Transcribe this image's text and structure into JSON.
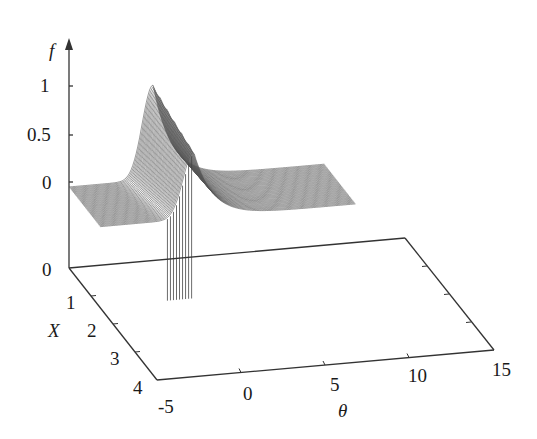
{
  "chart_data": {
    "type": "surface3d",
    "title": "",
    "axes": {
      "z": {
        "label": "f",
        "ticks": [
          "0",
          "0.5",
          "1"
        ],
        "range": [
          0,
          1.1
        ]
      },
      "x": {
        "label": "X",
        "ticks": [
          "0",
          "1",
          "2",
          "3",
          "4"
        ],
        "range": [
          0,
          4
        ]
      },
      "y": {
        "label": "θ",
        "ticks": [
          "-5",
          "0",
          "5",
          "10",
          "15"
        ],
        "range": [
          -5,
          15
        ]
      }
    },
    "peak": {
      "theta": 0,
      "X": 0,
      "f": 1.05
    },
    "profile_at_X0": {
      "theta": [
        -5,
        -3,
        -2,
        -1,
        -0.5,
        0,
        0.5,
        1,
        2,
        3,
        5,
        10,
        15
      ],
      "f": [
        0,
        0.02,
        0.08,
        0.35,
        0.75,
        1.05,
        0.8,
        0.55,
        0.25,
        0.08,
        0.01,
        0,
        0
      ]
    },
    "grid": false,
    "legend": null
  },
  "labels": {
    "f_axis": "f",
    "x_axis": "X",
    "theta_axis": "θ",
    "f_ticks": [
      {
        "t": "1",
        "x": 40,
        "y": 76
      },
      {
        "t": "0.5",
        "x": 27,
        "y": 125
      },
      {
        "t": "0",
        "x": 42,
        "y": 173
      }
    ],
    "base_zero": {
      "t": "0",
      "x": 42,
      "y": 260
    },
    "x_ticks": [
      {
        "t": "1",
        "x": 66,
        "y": 293
      },
      {
        "t": "2",
        "x": 87,
        "y": 321
      },
      {
        "t": "3",
        "x": 110,
        "y": 349
      },
      {
        "t": "4",
        "x": 133,
        "y": 378
      }
    ],
    "theta_ticks": [
      {
        "t": "-5",
        "x": 158,
        "y": 397
      },
      {
        "t": "0",
        "x": 243,
        "y": 384
      },
      {
        "t": "5",
        "x": 330,
        "y": 375
      },
      {
        "t": "10",
        "x": 408,
        "y": 366
      },
      {
        "t": "15",
        "x": 492,
        "y": 360
      }
    ]
  }
}
